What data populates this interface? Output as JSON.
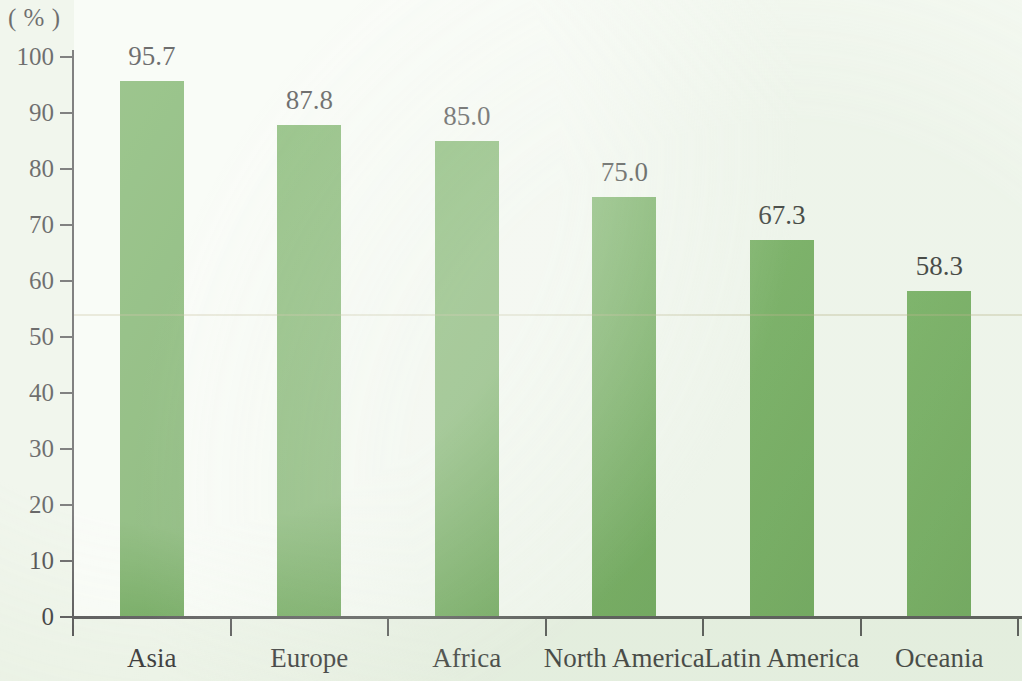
{
  "chart_data": {
    "type": "bar",
    "title": "",
    "subtitle": "",
    "xlabel": "",
    "ylabel": "",
    "unit_caption": "( % )",
    "categories": [
      "Asia",
      "Europe",
      "Africa",
      "North America",
      "Latin America",
      "Oceania"
    ],
    "values": [
      95.7,
      87.8,
      85.0,
      75.0,
      67.3,
      58.3
    ],
    "value_labels": [
      "95.7",
      "87.8",
      "85.0",
      "75.0",
      "67.3",
      "58.3"
    ],
    "ylim": [
      0,
      100
    ],
    "ytick_step": 10,
    "ytick_labels": [
      "100",
      "90",
      "80",
      "70",
      "60",
      "50",
      "40",
      "30",
      "20",
      "10",
      "0"
    ],
    "ytick_values": [
      100,
      90,
      80,
      70,
      60,
      50,
      40,
      30,
      20,
      10,
      0
    ],
    "grid": false,
    "legend": false,
    "legend_position": "none",
    "bar_color": "#5ba043",
    "axis_color": "#3a3a3a",
    "text_color": "#1d1d1d",
    "plot_background": "#f6faf3",
    "page_background": "#e9f1e3"
  }
}
